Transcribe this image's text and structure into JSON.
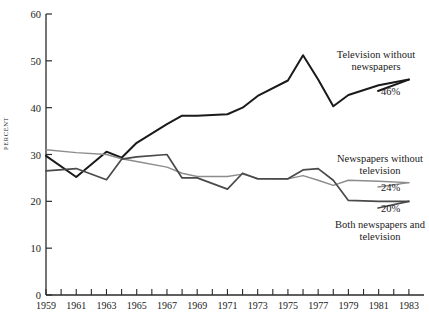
{
  "chart_data": {
    "type": "line",
    "title": "",
    "subtitle": "",
    "xlabel": "",
    "ylabel": "PERCENT",
    "ylim": [
      0,
      60
    ],
    "xlim": [
      1959,
      1984
    ],
    "grid": false,
    "legend_position": "inline-annotations",
    "y_ticks": [
      0,
      10,
      20,
      30,
      40,
      50,
      60
    ],
    "x_ticks": [
      1959,
      1960,
      1961,
      1962,
      1963,
      1964,
      1965,
      1966,
      1967,
      1968,
      1969,
      1970,
      1971,
      1972,
      1973,
      1974,
      1975,
      1976,
      1977,
      1978,
      1979,
      1980,
      1981,
      1982,
      1983
    ],
    "x_tick_labels": [
      "1959",
      "",
      "1961",
      "",
      "1963",
      "",
      "1965",
      "",
      "1967",
      "",
      "1969",
      "",
      "1971",
      "",
      "1973",
      "",
      "1975",
      "",
      "1977",
      "",
      "1979",
      "",
      "1981",
      "",
      "1983"
    ],
    "x": [
      1959,
      1961,
      1963,
      1964,
      1965,
      1967,
      1968,
      1969,
      1971,
      1972,
      1973,
      1975,
      1976,
      1977,
      1978,
      1979,
      1981,
      1983
    ],
    "series": [
      {
        "name": "Television without newspapers",
        "color": "#1a1a1a",
        "width": 2.0,
        "end_label": "46%",
        "values": [
          29.7,
          25.2,
          30.6,
          29.3,
          32.5,
          36.5,
          38.3,
          38.3,
          38.6,
          40.0,
          42.5,
          45.8,
          51.2,
          46.0,
          40.3,
          42.7,
          44.8,
          46.0
        ]
      },
      {
        "name": "Newspapers without television",
        "color": "#8c8c8c",
        "width": 1.4,
        "end_label": "24%",
        "values": [
          31.0,
          30.4,
          30.0,
          29.1,
          28.5,
          27.3,
          26.0,
          25.3,
          25.3,
          25.8,
          24.9,
          24.8,
          25.5,
          24.5,
          23.4,
          24.5,
          24.3,
          24.0
        ]
      },
      {
        "name": "Both newspapers and television",
        "color": "#4a4a4a",
        "width": 1.7,
        "end_label": "20%",
        "values": [
          26.5,
          27.0,
          24.6,
          29.0,
          29.5,
          30.0,
          25.0,
          25.0,
          22.6,
          26.0,
          24.8,
          24.8,
          26.7,
          27.0,
          24.5,
          20.2,
          20.0,
          20.0
        ]
      }
    ],
    "annotations": [
      {
        "id": "tv-without-news",
        "text_line1": "Television without",
        "text_line2": "newspapers",
        "value": "46%"
      },
      {
        "id": "news-without-tv",
        "text_line1": "Newspapers without",
        "text_line2": "television",
        "value": "24%"
      },
      {
        "id": "both-news-and-tv",
        "text_line1": "Both newspapers and",
        "text_line2": "television",
        "value": "20%"
      }
    ]
  },
  "axis": {
    "y_label": "PERCENT",
    "y_tick_labels": [
      "60",
      "50",
      "40",
      "30",
      "20",
      "10",
      "0"
    ],
    "x_tick_labels_visible": [
      "1959",
      "1961",
      "1963",
      "1965",
      "1967",
      "1969",
      "1971",
      "1973",
      "1975",
      "1977",
      "1979",
      "1981",
      "1983"
    ]
  },
  "colors": {
    "axis": "#2a2a2a",
    "background": "#ffffff",
    "series_tv": "#1a1a1a",
    "series_news": "#8c8c8c",
    "series_both": "#4a4a4a"
  }
}
